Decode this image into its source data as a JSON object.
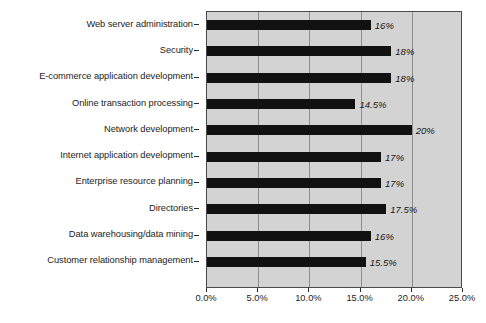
{
  "chart_data": {
    "type": "bar",
    "orientation": "horizontal",
    "title": "",
    "xlabel": "",
    "ylabel": "",
    "xlim": [
      0,
      25
    ],
    "xtick_labels": [
      "0.0%",
      "5.0%",
      "10.0%",
      "15.0%",
      "20.0%",
      "25.0%"
    ],
    "xtick_values": [
      0,
      5,
      10,
      15,
      20,
      25
    ],
    "grid": true,
    "legend": "none",
    "plot_background": "#d3d3d3",
    "bar_color": "#111111",
    "categories": [
      "Web server administration",
      "Security",
      "E-commerce application development",
      "Online transaction processing",
      "Network development",
      "Internet application development",
      "Enterprise resource planning",
      "Directories",
      "Data warehousing/data mining",
      "Customer relationship management"
    ],
    "values": [
      16,
      18,
      18,
      14.5,
      20,
      17,
      17,
      17.5,
      16,
      15.5
    ],
    "data_labels": [
      "16%",
      "18%",
      "18%",
      "14.5%",
      "20%",
      "17%",
      "17%",
      "17.5%",
      "16%",
      "15.5%"
    ]
  },
  "caption": ""
}
